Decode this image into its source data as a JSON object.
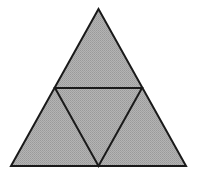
{
  "diagram": {
    "type": "subdivided-equilateral-triangle",
    "fill_color": "#a9a9a9",
    "stroke_color": "#1a1a1a",
    "background": "#ffffff",
    "stroke_width": 2,
    "outer_triangle": {
      "apex": [
        98.5,
        9
      ],
      "bottom_left": [
        11,
        166
      ],
      "bottom_right": [
        186,
        166
      ]
    },
    "midpoints": {
      "left": [
        55,
        88
      ],
      "right": [
        142,
        88
      ],
      "bottom": [
        98.5,
        166
      ]
    },
    "sub_triangles": [
      {
        "name": "top",
        "points": [
          [
            98.5,
            9
          ],
          [
            55,
            88
          ],
          [
            142,
            88
          ]
        ]
      },
      {
        "name": "bottom-left",
        "points": [
          [
            55,
            88
          ],
          [
            11,
            166
          ],
          [
            98.5,
            166
          ]
        ]
      },
      {
        "name": "center-inverted",
        "points": [
          [
            55,
            88
          ],
          [
            142,
            88
          ],
          [
            98.5,
            166
          ]
        ]
      },
      {
        "name": "bottom-right",
        "points": [
          [
            142,
            88
          ],
          [
            98.5,
            166
          ],
          [
            186,
            166
          ]
        ]
      }
    ]
  }
}
